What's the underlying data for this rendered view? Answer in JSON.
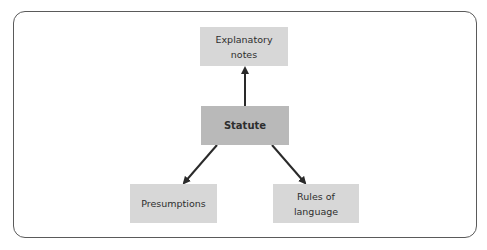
{
  "diagram": {
    "type": "hierarchy",
    "colors": {
      "frame_border": "#5a5a5a",
      "root_fill": "#b9b9b9",
      "leaf_fill": "#d7d7d7",
      "text": "#2e2e2e",
      "arrow": "#2a2a2a"
    },
    "nodes": {
      "explanatory_notes": {
        "label": "Explanatory\nnotes"
      },
      "statute": {
        "label": "Statute"
      },
      "presumptions": {
        "label": "Presumptions"
      },
      "rules_of_language": {
        "label": "Rules of\nlanguage"
      }
    },
    "edges": [
      {
        "from": "Statute",
        "to": "Explanatory notes"
      },
      {
        "from": "Statute",
        "to": "Presumptions"
      },
      {
        "from": "Statute",
        "to": "Rules of language"
      }
    ]
  }
}
